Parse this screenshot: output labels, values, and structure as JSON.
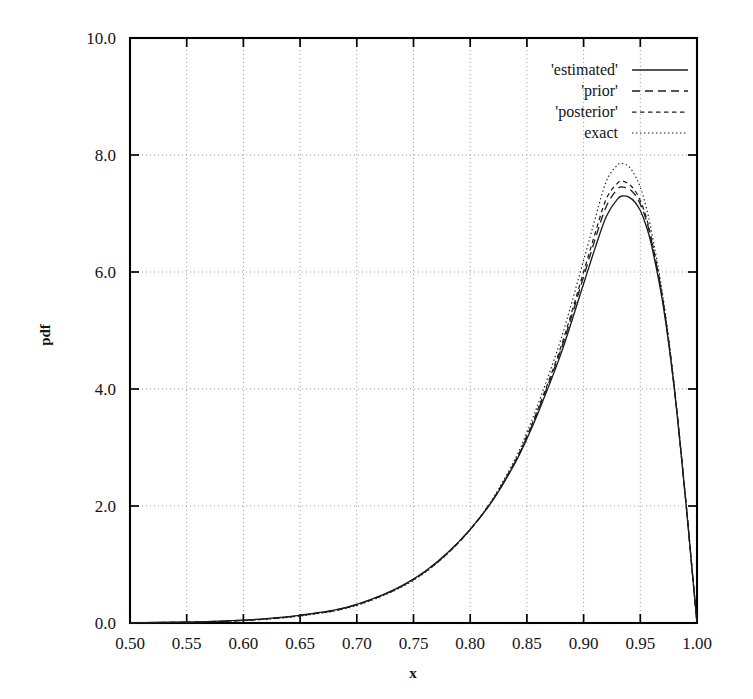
{
  "chart_data": {
    "type": "line",
    "title": "",
    "subtitle": "",
    "xlabel": "x",
    "ylabel": "pdf",
    "xlim": [
      0.5,
      1.0
    ],
    "ylim": [
      0.0,
      10.0
    ],
    "grid": true,
    "legend_position": "top-right",
    "xticks": [
      "0.50",
      "0.55",
      "0.60",
      "0.65",
      "0.70",
      "0.75",
      "0.80",
      "0.85",
      "0.90",
      "0.95",
      "1.00"
    ],
    "xtick_values": [
      0.5,
      0.55,
      0.6,
      0.65,
      0.7,
      0.75,
      0.8,
      0.85,
      0.9,
      0.95,
      1.0
    ],
    "yticks": [
      "0.0",
      "2.0",
      "4.0",
      "6.0",
      "8.0",
      "10.0"
    ],
    "ytick_values": [
      0.0,
      2.0,
      4.0,
      6.0,
      8.0,
      10.0
    ],
    "x": [
      0.5,
      0.52,
      0.54,
      0.56,
      0.58,
      0.6,
      0.62,
      0.64,
      0.65,
      0.66,
      0.68,
      0.7,
      0.72,
      0.74,
      0.76,
      0.78,
      0.8,
      0.82,
      0.84,
      0.85,
      0.86,
      0.88,
      0.9,
      0.91,
      0.92,
      0.93,
      0.935,
      0.94,
      0.945,
      0.95,
      0.955,
      0.96,
      0.97,
      0.98,
      0.99,
      0.995,
      1.0
    ],
    "series": [
      {
        "name": "'estimated'",
        "style": "solid",
        "color": "#1c1c1c",
        "values": [
          0.005,
          0.008,
          0.013,
          0.02,
          0.032,
          0.05,
          0.075,
          0.11,
          0.135,
          0.16,
          0.22,
          0.32,
          0.46,
          0.64,
          0.88,
          1.2,
          1.6,
          2.1,
          2.75,
          3.15,
          3.6,
          4.6,
          5.8,
          6.4,
          6.95,
          7.25,
          7.3,
          7.28,
          7.2,
          7.05,
          6.8,
          6.45,
          5.45,
          4.0,
          2.1,
          1.05,
          0.0
        ]
      },
      {
        "name": "'prior'",
        "style": "dashed-long",
        "color": "#1c1c1c",
        "values": [
          0.004,
          0.007,
          0.012,
          0.018,
          0.029,
          0.046,
          0.07,
          0.105,
          0.128,
          0.155,
          0.215,
          0.315,
          0.455,
          0.635,
          0.875,
          1.195,
          1.6,
          2.11,
          2.77,
          3.18,
          3.64,
          4.67,
          5.92,
          6.55,
          7.12,
          7.42,
          7.45,
          7.42,
          7.33,
          7.16,
          6.9,
          6.52,
          5.5,
          4.02,
          2.11,
          1.05,
          0.0
        ]
      },
      {
        "name": "'posterior'",
        "style": "dashed-medium",
        "color": "#1c1c1c",
        "values": [
          0.004,
          0.007,
          0.011,
          0.018,
          0.028,
          0.045,
          0.068,
          0.102,
          0.125,
          0.152,
          0.21,
          0.31,
          0.45,
          0.63,
          0.87,
          1.19,
          1.595,
          2.11,
          2.78,
          3.2,
          3.67,
          4.72,
          6.0,
          6.65,
          7.25,
          7.52,
          7.55,
          7.5,
          7.4,
          7.22,
          6.95,
          6.55,
          5.52,
          4.03,
          2.11,
          1.05,
          0.0
        ]
      },
      {
        "name": "exact",
        "style": "dotted",
        "color": "#1c1c1c",
        "values": [
          0.003,
          0.006,
          0.01,
          0.016,
          0.026,
          0.042,
          0.064,
          0.097,
          0.119,
          0.145,
          0.202,
          0.3,
          0.44,
          0.62,
          0.86,
          1.185,
          1.6,
          2.13,
          2.82,
          3.26,
          3.75,
          4.85,
          6.2,
          6.9,
          7.55,
          7.83,
          7.85,
          7.8,
          7.66,
          7.45,
          7.12,
          6.68,
          5.58,
          4.05,
          2.12,
          1.05,
          0.0
        ]
      }
    ]
  },
  "axes": {
    "xlabel": "x",
    "ylabel": "pdf"
  },
  "legend": {
    "entries": [
      {
        "label": "'estimated'",
        "style": "solid"
      },
      {
        "label": "'prior'",
        "style": "dashed-long"
      },
      {
        "label": "'posterior'",
        "style": "dashed-medium"
      },
      {
        "label": "exact",
        "style": "dotted"
      }
    ]
  }
}
